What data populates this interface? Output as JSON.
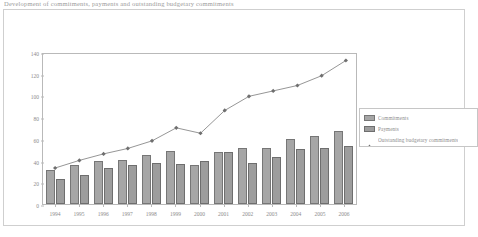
{
  "caption": "Development of commitments, payments and outstanding budgetary commitments",
  "chart_data": {
    "type": "bar",
    "title": "",
    "xlabel": "",
    "ylabel": "",
    "ylim": [
      0,
      140
    ],
    "yticks": [
      0,
      20,
      40,
      60,
      80,
      100,
      120,
      140
    ],
    "grid": false,
    "legend_position": "right",
    "categories": [
      "1994",
      "1995",
      "1996",
      "1997",
      "1998",
      "1999",
      "2000",
      "2001",
      "2002",
      "2003",
      "2004",
      "2005",
      "2006"
    ],
    "series": [
      {
        "name": "Commitments",
        "type": "bar",
        "color": "#a6a6a6",
        "values": [
          31,
          36,
          40,
          41,
          45,
          49,
          36,
          48,
          52,
          52,
          60,
          63,
          67
        ]
      },
      {
        "name": "Payments",
        "type": "bar",
        "color": "#9d9d9d",
        "values": [
          23,
          27,
          33,
          36,
          38,
          37,
          40,
          48,
          38,
          43,
          51,
          52,
          53
        ]
      },
      {
        "name": "Outstanding budgetary commitments",
        "type": "line",
        "color": "#8a8a8a",
        "values": [
          35,
          42,
          48,
          53,
          60,
          72,
          67,
          88,
          101,
          106,
          111,
          120,
          134
        ]
      }
    ]
  },
  "legend": {
    "items": [
      {
        "label": "Commitments",
        "marker": "swatch-commitments"
      },
      {
        "label": "Payments",
        "marker": "swatch-payments"
      },
      {
        "label": "Outstanding budgetary commitments",
        "marker": "line-marker"
      }
    ]
  }
}
